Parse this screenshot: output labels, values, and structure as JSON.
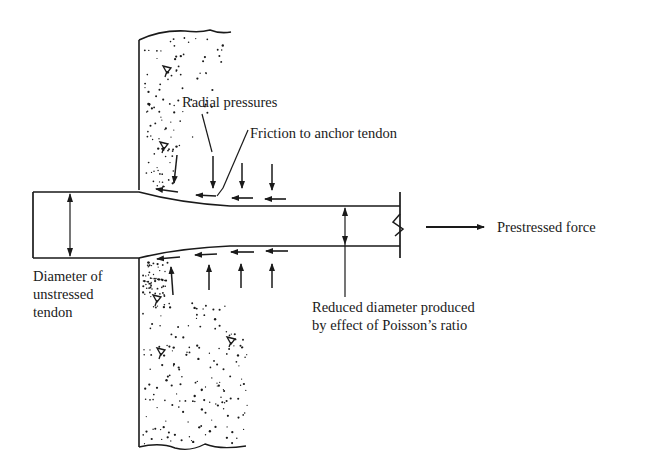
{
  "labels": {
    "radial_pressures": "Radial pressures",
    "friction": "Friction to anchor tendon",
    "prestressed_force": "Prestressed force",
    "unstressed_line1": "Diameter of",
    "unstressed_line2": "unstressed",
    "unstressed_line3": "tendon",
    "reduced_line1": "Reduced diameter produced",
    "reduced_line2": "by effect of Poisson’s ratio"
  },
  "colors": {
    "ink": "#1a1a1a",
    "background": "#ffffff"
  }
}
